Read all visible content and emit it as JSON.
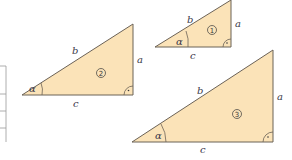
{
  "figure": {
    "colors": {
      "fill": "#fbe3b8",
      "stroke": "#6b6257",
      "text": "#3a3a4a"
    },
    "triangles": [
      {
        "id": "1",
        "number_label": "1",
        "side_a": "a",
        "side_b": "b",
        "side_c": "c",
        "angle": "α"
      },
      {
        "id": "2",
        "number_label": "2",
        "side_a": "a",
        "side_b": "b",
        "side_c": "c",
        "angle": "α"
      },
      {
        "id": "3",
        "number_label": "3",
        "side_a": "a",
        "side_b": "b",
        "side_c": "c",
        "angle": "α"
      }
    ],
    "table": {
      "visible_rows": 4
    }
  }
}
